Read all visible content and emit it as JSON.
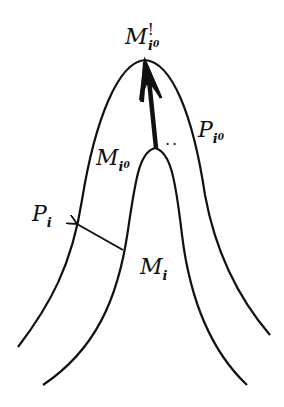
{
  "figure": {
    "labels": {
      "M_prime_i0": {
        "base": "M",
        "prime": "!",
        "sub": "i",
        "subsub": "0"
      },
      "P_i0": {
        "base": "P",
        "sub": "i",
        "subsub": "0"
      },
      "M_i0": {
        "base": "M",
        "sub": "i",
        "subsub": "0"
      },
      "P_i": {
        "base": "P",
        "sub": "i"
      },
      "M_i": {
        "base": "M",
        "sub": "i"
      }
    },
    "dots": "..",
    "colors": {
      "stroke": "#111111",
      "background": "#ffffff"
    }
  }
}
